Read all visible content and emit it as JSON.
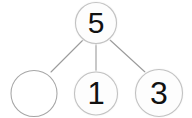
{
  "diagram": {
    "type": "number-bond",
    "whole": {
      "value": "5",
      "filled": true
    },
    "parts": [
      {
        "value": "",
        "filled": false,
        "position": "left"
      },
      {
        "value": "1",
        "filled": true,
        "position": "middle"
      },
      {
        "value": "3",
        "filled": true,
        "position": "right"
      }
    ],
    "connectors": [
      {
        "from": "whole",
        "to": "left-part"
      },
      {
        "from": "whole",
        "to": "middle-part"
      },
      {
        "from": "whole",
        "to": "right-part"
      }
    ],
    "colors": {
      "background": "#ffffff",
      "circle_fill": "#fdfdfd",
      "circle_ring": "#e9e9e9",
      "circle_outline": "#b8b8b8",
      "empty_circle_outline": "#9a9a9a",
      "connector_line": "#9b9b9b",
      "digit_color": "#111111"
    }
  }
}
